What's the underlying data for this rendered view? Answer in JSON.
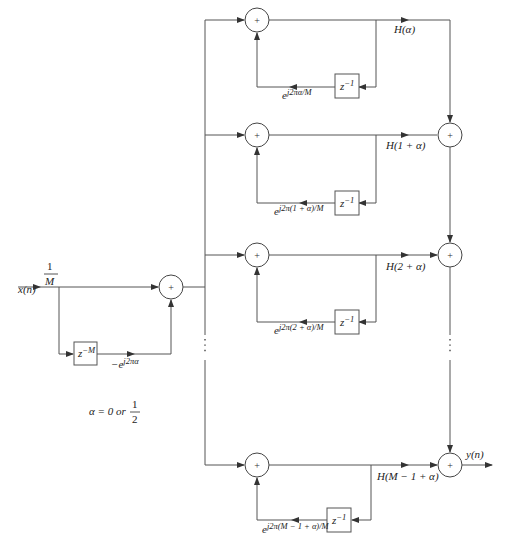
{
  "diagram": {
    "title": "",
    "input": {
      "label": "x(n)",
      "gain_num": "1",
      "gain_den": "M"
    },
    "comb": {
      "delay_label": "z−M",
      "delay_base": "z",
      "delay_exp": "−M",
      "coef_label": "−e^{j2πα}",
      "coef_base": "−e",
      "coef_exp": "j2πα"
    },
    "alpha_note": {
      "text": "α = 0 or ",
      "frac_num": "1",
      "frac_den": "2"
    },
    "output": {
      "label": "y(n)"
    },
    "adder_symbol": "+",
    "branches": [
      {
        "h_label": "H(α)",
        "delay_base": "z",
        "delay_exp": "−1",
        "coef_base": "e",
        "coef_exp": "j2πα/M"
      },
      {
        "h_label": "H(1 + α)",
        "delay_base": "z",
        "delay_exp": "−1",
        "coef_base": "e",
        "coef_exp": "j2π(1 + α)/M"
      },
      {
        "h_label": "H(2 + α)",
        "delay_base": "z",
        "delay_exp": "−1",
        "coef_base": "e",
        "coef_exp": "j2π(2 + α)/M"
      },
      {
        "h_label": "H(M − 1 + α)",
        "delay_base": "z",
        "delay_exp": "−1",
        "coef_base": "e",
        "coef_exp": "j2π(M − 1 + α)/M"
      }
    ],
    "ellipsis": "⋮"
  }
}
